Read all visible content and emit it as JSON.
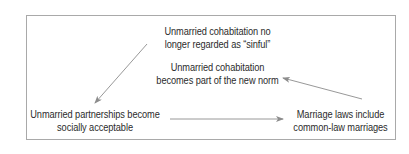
{
  "diagram": {
    "title": "",
    "nodes": [
      {
        "id": "sinful",
        "lines": [
          "Unmarried cohabitation no",
          "longer regarded as “sinful”"
        ]
      },
      {
        "id": "norm",
        "lines": [
          "Unmarried cohabitation",
          "becomes part of the new norm"
        ]
      },
      {
        "id": "accept",
        "lines": [
          "Unmarried partnerships become",
          "socially acceptable"
        ]
      },
      {
        "id": "laws",
        "lines": [
          "Marriage laws include",
          "common-law marriages"
        ]
      }
    ],
    "edges": [
      {
        "from": "sinful",
        "to": "accept"
      },
      {
        "from": "accept",
        "to": "laws"
      },
      {
        "from": "laws",
        "to": "norm"
      }
    ],
    "colors": {
      "text": "#2b2b2b",
      "border": "#a9a9a9",
      "arrow": "#8c8c8c",
      "background": "#ffffff"
    }
  }
}
